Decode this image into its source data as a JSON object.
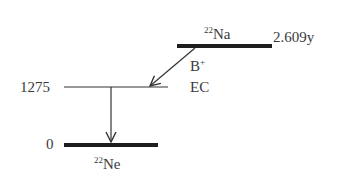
{
  "diagram": {
    "type": "nuclear-decay-scheme",
    "parent": {
      "mass_number": "22",
      "symbol": "Na",
      "half_life": "2.609y"
    },
    "daughter": {
      "mass_number": "22",
      "symbol": "Ne"
    },
    "levels": [
      {
        "energy": "1275",
        "label": "1275"
      },
      {
        "energy": "0",
        "label": "0"
      }
    ],
    "decay_modes": {
      "beta_base": "B",
      "beta_sup": "+",
      "ec": "EC"
    },
    "colors": {
      "line": "#222222",
      "text": "#3a3a3a"
    }
  }
}
